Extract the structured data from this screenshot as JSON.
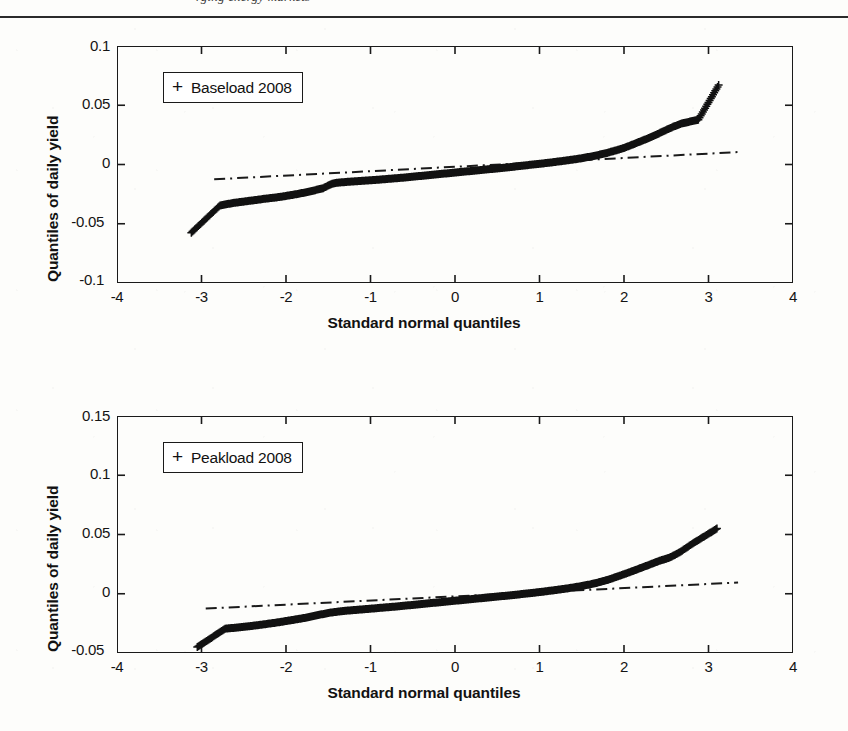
{
  "page": {
    "running_head": "rging energy markets",
    "background_color": "#fdfdfb",
    "ink_color": "#1a1a1a"
  },
  "charts": [
    {
      "id": "baseload-2008",
      "legend_marker": "+",
      "legend_label": "Baseload 2008",
      "xlabel": "Standard normal quantiles",
      "ylabel": "Quantiles of daily yield",
      "xticks": [
        "-4",
        "-3",
        "-2",
        "-1",
        "0",
        "1",
        "2",
        "3",
        "4"
      ],
      "yticks": [
        "0.1",
        "0.05",
        "0",
        "-0.05",
        "-0.1"
      ]
    },
    {
      "id": "peakload-2008",
      "legend_marker": "+",
      "legend_label": "Peakload 2008",
      "xlabel": "Standard normal quantiles",
      "ylabel": "Quantiles of daily yield",
      "xticks": [
        "-4",
        "-3",
        "-2",
        "-1",
        "0",
        "1",
        "2",
        "3",
        "4"
      ],
      "yticks": [
        "0.15",
        "0.1",
        "0.05",
        "0",
        "-0.05"
      ]
    }
  ],
  "chart_data": [
    {
      "type": "scatter",
      "id": "baseload-2008",
      "title": "",
      "xlabel": "Standard normal quantiles",
      "ylabel": "Quantiles of daily yield",
      "xlim": [
        -4,
        4
      ],
      "ylim": [
        -0.1,
        0.1
      ],
      "xticks": [
        -4,
        -3,
        -2,
        -1,
        0,
        1,
        2,
        3,
        4
      ],
      "yticks": [
        -0.1,
        -0.05,
        0,
        0.05,
        0.1
      ],
      "grid": false,
      "legend": {
        "label": "Baseload 2008",
        "marker": "+",
        "position": "upper-left"
      },
      "marker": "+",
      "annotations": [
        "dash-dot robust reference line through the quartiles"
      ],
      "reference_line": {
        "style": "dash-dot",
        "x": [
          -2.85,
          3.35
        ],
        "y": [
          -0.0125,
          0.0105
        ]
      },
      "points": [
        [
          -3.12,
          -0.0575
        ],
        [
          -2.78,
          -0.0345
        ],
        [
          -2.68,
          -0.0332
        ],
        [
          -2.6,
          -0.0322
        ],
        [
          -2.52,
          -0.0315
        ],
        [
          -2.45,
          -0.0308
        ],
        [
          -2.38,
          -0.0302
        ],
        [
          -2.32,
          -0.0296
        ],
        [
          -2.26,
          -0.029
        ],
        [
          -2.2,
          -0.0285
        ],
        [
          -2.14,
          -0.028
        ],
        [
          -2.09,
          -0.0275
        ],
        [
          -2.04,
          -0.027
        ],
        [
          -1.99,
          -0.0264
        ],
        [
          -1.94,
          -0.0258
        ],
        [
          -1.89,
          -0.0252
        ],
        [
          -1.85,
          -0.0246
        ],
        [
          -1.8,
          -0.024
        ],
        [
          -1.76,
          -0.0234
        ],
        [
          -1.72,
          -0.0228
        ],
        [
          -1.68,
          -0.0221
        ],
        [
          -1.64,
          -0.0214
        ],
        [
          -1.6,
          -0.0207
        ],
        [
          -1.56,
          -0.02
        ],
        [
          -1.52,
          -0.0185
        ],
        [
          -1.48,
          -0.017
        ],
        [
          -1.44,
          -0.016
        ],
        [
          -1.4,
          -0.0154
        ],
        [
          -1.3,
          -0.0148
        ],
        [
          -1.2,
          -0.0143
        ],
        [
          -1.1,
          -0.0138
        ],
        [
          -1.0,
          -0.0133
        ],
        [
          -0.9,
          -0.0128
        ],
        [
          -0.8,
          -0.0122
        ],
        [
          -0.7,
          -0.0116
        ],
        [
          -0.6,
          -0.011
        ],
        [
          -0.5,
          -0.0103
        ],
        [
          -0.4,
          -0.0096
        ],
        [
          -0.3,
          -0.0089
        ],
        [
          -0.2,
          -0.0082
        ],
        [
          -0.1,
          -0.0075
        ],
        [
          0.0,
          -0.0068
        ],
        [
          0.1,
          -0.0061
        ],
        [
          0.2,
          -0.0054
        ],
        [
          0.3,
          -0.0047
        ],
        [
          0.4,
          -0.004
        ],
        [
          0.5,
          -0.0033
        ],
        [
          0.6,
          -0.0026
        ],
        [
          0.7,
          -0.0018
        ],
        [
          0.8,
          -0.001
        ],
        [
          0.9,
          -0.0002
        ],
        [
          1.0,
          0.0006
        ],
        [
          1.1,
          0.0014
        ],
        [
          1.2,
          0.0023
        ],
        [
          1.3,
          0.0032
        ],
        [
          1.4,
          0.0042
        ],
        [
          1.5,
          0.0053
        ],
        [
          1.6,
          0.0066
        ],
        [
          1.7,
          0.0081
        ],
        [
          1.8,
          0.0098
        ],
        [
          1.9,
          0.0118
        ],
        [
          2.0,
          0.014
        ],
        [
          2.08,
          0.0162
        ],
        [
          2.16,
          0.0185
        ],
        [
          2.24,
          0.0208
        ],
        [
          2.32,
          0.0232
        ],
        [
          2.4,
          0.0258
        ],
        [
          2.48,
          0.0285
        ],
        [
          2.58,
          0.0318
        ],
        [
          2.68,
          0.0345
        ],
        [
          2.78,
          0.0362
        ],
        [
          2.88,
          0.0378
        ],
        [
          3.12,
          0.067
        ]
      ],
      "description": "Normal QQ plot of daily yields: S-shaped curve with heavy tails on both ends"
    },
    {
      "type": "scatter",
      "id": "peakload-2008",
      "title": "",
      "xlabel": "Standard normal quantiles",
      "ylabel": "Quantiles of daily yield",
      "xlim": [
        -4,
        4
      ],
      "ylim": [
        -0.05,
        0.15
      ],
      "xticks": [
        -4,
        -3,
        -2,
        -1,
        0,
        1,
        2,
        3,
        4
      ],
      "yticks": [
        -0.05,
        0,
        0.05,
        0.1,
        0.15
      ],
      "grid": false,
      "legend": {
        "label": "Peakload 2008",
        "marker": "+",
        "position": "upper-left"
      },
      "marker": "+",
      "annotations": [
        "dash-dot robust reference line through the quartiles"
      ],
      "reference_line": {
        "style": "dash-dot",
        "x": [
          -2.95,
          3.35
        ],
        "y": [
          -0.0125,
          0.0095
        ]
      },
      "points": [
        [
          -3.05,
          -0.045
        ],
        [
          -2.72,
          -0.0295
        ],
        [
          -2.62,
          -0.0288
        ],
        [
          -2.54,
          -0.0282
        ],
        [
          -2.46,
          -0.0276
        ],
        [
          -2.39,
          -0.027
        ],
        [
          -2.32,
          -0.0264
        ],
        [
          -2.26,
          -0.0258
        ],
        [
          -2.2,
          -0.0252
        ],
        [
          -2.14,
          -0.0246
        ],
        [
          -2.08,
          -0.024
        ],
        [
          -2.03,
          -0.0234
        ],
        [
          -1.98,
          -0.0228
        ],
        [
          -1.93,
          -0.0222
        ],
        [
          -1.88,
          -0.0216
        ],
        [
          -1.83,
          -0.021
        ],
        [
          -1.78,
          -0.0204
        ],
        [
          -1.74,
          -0.0198
        ],
        [
          -1.7,
          -0.0192
        ],
        [
          -1.66,
          -0.0186
        ],
        [
          -1.62,
          -0.018
        ],
        [
          -1.58,
          -0.0174
        ],
        [
          -1.54,
          -0.0168
        ],
        [
          -1.5,
          -0.0162
        ],
        [
          -1.44,
          -0.0156
        ],
        [
          -1.38,
          -0.015
        ],
        [
          -1.3,
          -0.0144
        ],
        [
          -1.2,
          -0.0138
        ],
        [
          -1.1,
          -0.0132
        ],
        [
          -1.0,
          -0.0126
        ],
        [
          -0.9,
          -0.012
        ],
        [
          -0.8,
          -0.0114
        ],
        [
          -0.7,
          -0.0108
        ],
        [
          -0.6,
          -0.0101
        ],
        [
          -0.5,
          -0.0094
        ],
        [
          -0.4,
          -0.0087
        ],
        [
          -0.3,
          -0.008
        ],
        [
          -0.2,
          -0.0073
        ],
        [
          -0.1,
          -0.0066
        ],
        [
          0.0,
          -0.0059
        ],
        [
          0.1,
          -0.0052
        ],
        [
          0.2,
          -0.0045
        ],
        [
          0.3,
          -0.0038
        ],
        [
          0.4,
          -0.0031
        ],
        [
          0.5,
          -0.0024
        ],
        [
          0.6,
          -0.0017
        ],
        [
          0.7,
          -0.001
        ],
        [
          0.8,
          -0.0002
        ],
        [
          0.9,
          0.0006
        ],
        [
          1.0,
          0.0014
        ],
        [
          1.1,
          0.0023
        ],
        [
          1.2,
          0.0032
        ],
        [
          1.3,
          0.0042
        ],
        [
          1.4,
          0.0053
        ],
        [
          1.5,
          0.0065
        ],
        [
          1.6,
          0.0079
        ],
        [
          1.7,
          0.0096
        ],
        [
          1.8,
          0.0116
        ],
        [
          1.88,
          0.0135
        ],
        [
          1.96,
          0.0155
        ],
        [
          2.04,
          0.0175
        ],
        [
          2.12,
          0.0196
        ],
        [
          2.2,
          0.0218
        ],
        [
          2.3,
          0.0245
        ],
        [
          2.42,
          0.0278
        ],
        [
          2.54,
          0.0305
        ],
        [
          2.66,
          0.035
        ],
        [
          2.8,
          0.0418
        ],
        [
          3.1,
          0.055
        ]
      ],
      "description": "Normal QQ plot of daily yields: S-shaped curve with heavy tails on both ends"
    }
  ]
}
